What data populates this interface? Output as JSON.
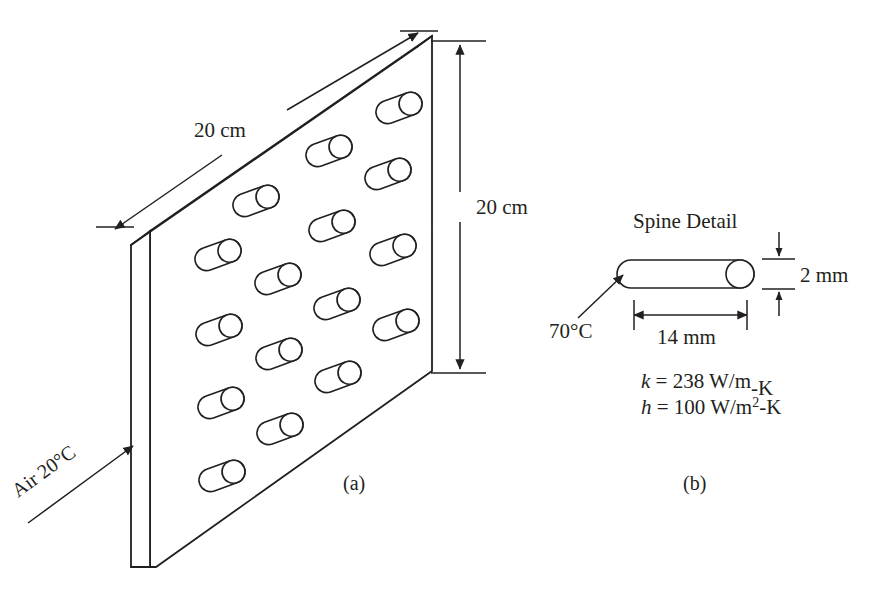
{
  "figure": {
    "panel_a": {
      "caption": "(a)",
      "dim_width_label": "20 cm",
      "dim_height_label": "20 cm",
      "flow_label": "Air 20°C",
      "pin_count": 18,
      "pin_rows": 6,
      "plate_description": "vertical flat plate with array of cylindrical pin fins (spines)"
    },
    "panel_b": {
      "caption": "(b)",
      "title": "Spine Detail",
      "base_temp_label": "70°C",
      "dim_length_label": "14 mm",
      "dim_diameter_label": "2 mm",
      "properties": [
        {
          "symbol": "k",
          "equals": " = ",
          "value": "238 W/m-K",
          "value_main": "238 W/m",
          "value_sup": "",
          "value_tail": "-K"
        },
        {
          "symbol": "h",
          "equals": " = ",
          "value": "100 W/m2-K",
          "value_main": "100 W/m",
          "value_sup": "2",
          "value_tail": "-K"
        }
      ]
    },
    "colors": {
      "ink": "#231f20",
      "paper": "#ffffff"
    }
  }
}
